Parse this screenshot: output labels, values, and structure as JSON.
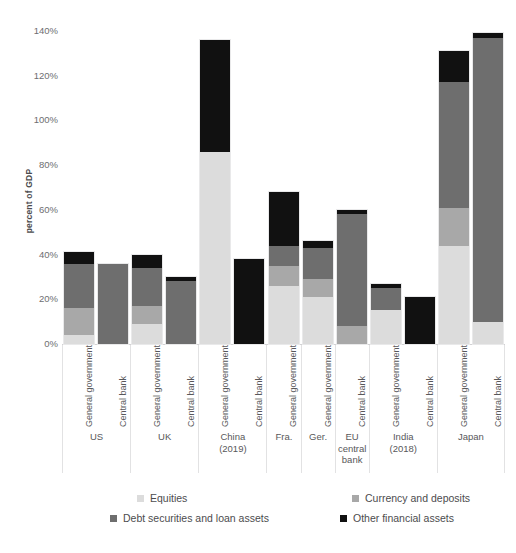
{
  "chart_data": {
    "type": "bar",
    "subtype": "stacked-bar",
    "title": "",
    "xlabel": "",
    "ylabel": "percent of GDP",
    "ylim": [
      0,
      140
    ],
    "ytick_labels": [
      "0%",
      "20%",
      "40%",
      "60%",
      "80%",
      "100%",
      "120%",
      "140%"
    ],
    "ytick_values": [
      0,
      20,
      40,
      60,
      80,
      100,
      120,
      140
    ],
    "grid": false,
    "legend_position": "bottom",
    "series": [
      {
        "name": "Equities",
        "color": "#dcdcdc"
      },
      {
        "name": "Currency and deposits",
        "color": "#a8a8a8"
      },
      {
        "name": "Debt securities and loan assets",
        "color": "#6e6e6e"
      },
      {
        "name": "Other financial assets",
        "color": "#111111"
      }
    ],
    "groups": [
      {
        "name": "US",
        "name_lines": [
          "US"
        ],
        "bars": [
          {
            "label": "General government",
            "values": [
              4,
              12,
              20,
              5
            ],
            "total": 41
          },
          {
            "label": "Central bank",
            "values": [
              0,
              0,
              36,
              0
            ],
            "total": 36
          }
        ]
      },
      {
        "name": "UK",
        "name_lines": [
          "UK"
        ],
        "bars": [
          {
            "label": "General government",
            "values": [
              9,
              8,
              17,
              6
            ],
            "total": 40
          },
          {
            "label": "Central bank",
            "values": [
              0,
              0,
              28,
              2
            ],
            "total": 30
          }
        ]
      },
      {
        "name": "China (2019)",
        "name_lines": [
          "China",
          "(2019)"
        ],
        "bars": [
          {
            "label": "General government",
            "values": [
              86,
              0,
              0,
              50
            ],
            "total": 136
          },
          {
            "label": "Central bank",
            "values": [
              0,
              0,
              0,
              38
            ],
            "total": 38
          }
        ]
      },
      {
        "name": "Fra.",
        "name_lines": [
          "Fra."
        ],
        "bars": [
          {
            "label": "General government",
            "values": [
              26,
              9,
              9,
              24
            ],
            "total": 68
          }
        ]
      },
      {
        "name": "Ger.",
        "name_lines": [
          "Ger."
        ],
        "bars": [
          {
            "label": "General government",
            "values": [
              21,
              8,
              14,
              3
            ],
            "total": 46
          }
        ]
      },
      {
        "name": "EU central bank",
        "name_lines": [
          "EU",
          "central",
          "bank"
        ],
        "bars": [
          {
            "label": "Central bank",
            "values": [
              0,
              8,
              50,
              2
            ],
            "total": 60
          }
        ]
      },
      {
        "name": "India (2018)",
        "name_lines": [
          "India",
          "(2018)"
        ],
        "bars": [
          {
            "label": "General government",
            "values": [
              15,
              0,
              10,
              2
            ],
            "total": 27
          },
          {
            "label": "Central bank",
            "values": [
              0,
              0,
              0,
              21
            ],
            "total": 21
          }
        ]
      },
      {
        "name": "Japan",
        "name_lines": [
          "Japan"
        ],
        "bars": [
          {
            "label": "General government",
            "values": [
              44,
              17,
              56,
              14
            ],
            "total": 131
          },
          {
            "label": "Central bank",
            "values": [
              10,
              0,
              127,
              2
            ],
            "total": 139
          }
        ]
      }
    ]
  }
}
